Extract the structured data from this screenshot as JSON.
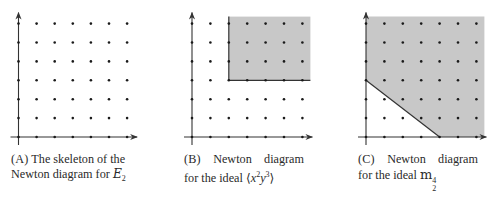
{
  "figure": {
    "grid": {
      "cols": 7,
      "rows": 7,
      "dot_color": "#1a1a1a",
      "axis_color": "#333333",
      "shade_color": "#c8c8c8"
    },
    "panels": [
      {
        "id": "A",
        "origin": [
          18.5,
          137
        ],
        "dx": 18.1,
        "dy": 18.9,
        "shaded_region": null,
        "caption": {
          "tag": "(A)",
          "line1": "The skeleton of the",
          "line2_text": "Newton diagram for ",
          "line2_math": "E",
          "line2_sub": "2"
        }
      },
      {
        "id": "B",
        "origin": [
          192,
          137
        ],
        "dx": 18.4,
        "dy": 18.9,
        "shaded_region": {
          "type": "quadrant",
          "corner": [
            2,
            3
          ],
          "description": "monomials x^a y^b with a>=2, b>=3"
        },
        "caption": {
          "tag": "(B)",
          "line1a": "Newton",
          "line1b": "diagram",
          "line2_text": "for the ideal ",
          "ideal_open": "⟨",
          "ideal_x": "x",
          "ideal_xexp": "2",
          "ideal_y": "y",
          "ideal_yexp": "3",
          "ideal_close": "⟩"
        }
      },
      {
        "id": "C",
        "origin": [
          366,
          137
        ],
        "dx": 18.4,
        "dy": 18.9,
        "shaded_region": {
          "type": "halfplane",
          "line_from": [
            0,
            3
          ],
          "line_to": [
            4,
            0
          ],
          "description": "region above segment from (0,3) to (4,0)"
        },
        "caption": {
          "tag": "(C)",
          "line1a": "Newton",
          "line1b": "diagram",
          "line2_text": "for the ideal ",
          "ideal_m": "m",
          "ideal_sub": "2",
          "ideal_sup": "4"
        }
      }
    ]
  }
}
